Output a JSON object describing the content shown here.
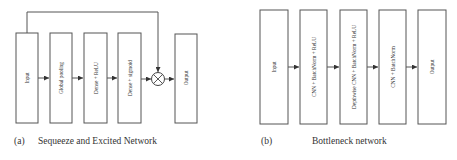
{
  "panels": [
    {
      "id": "a",
      "caption_tag": "(a)",
      "caption_text": "Sequeeze and Excited Network",
      "blocks": [
        {
          "label": "Input"
        },
        {
          "label": "Global pooling"
        },
        {
          "label": "Dense + ReLU"
        },
        {
          "label": "Dense + sigmoid"
        },
        {
          "label": "Output"
        }
      ],
      "operator": {
        "icon": "multiply-circle-icon",
        "symbol": "⊗"
      },
      "skip_connection": {
        "from": "Input",
        "to": "multiply-operator"
      }
    },
    {
      "id": "b",
      "caption_tag": "(b)",
      "caption_text": "Bottleneck network",
      "blocks": [
        {
          "label": "Input"
        },
        {
          "label": "CNN + BatchNorm + ReLU"
        },
        {
          "label": "Depthwise CNN + BatchNorm + ReLU"
        },
        {
          "label": "CNN + BatchNorm"
        },
        {
          "label": "Output"
        }
      ]
    }
  ],
  "colors": {
    "stroke": "#555555",
    "text": "#333333",
    "background": "#ffffff"
  }
}
